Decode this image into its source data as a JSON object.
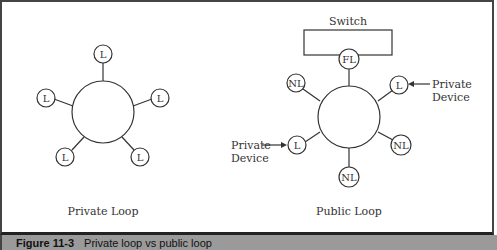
{
  "diagram": {
    "private_loop": {
      "label": "Private Loop",
      "nodes": [
        {
          "label": "L",
          "position": "top"
        },
        {
          "label": "L",
          "position": "upper-left"
        },
        {
          "label": "L",
          "position": "upper-right"
        },
        {
          "label": "L",
          "position": "lower-left"
        },
        {
          "label": "L",
          "position": "lower-right"
        }
      ]
    },
    "public_loop": {
      "label": "Public Loop",
      "switch_label": "Switch",
      "nodes": [
        {
          "label": "FL",
          "position": "top"
        },
        {
          "label": "NL",
          "position": "upper-left"
        },
        {
          "label": "L",
          "position": "upper-right"
        },
        {
          "label": "L",
          "position": "left"
        },
        {
          "label": "NL",
          "position": "lower-right"
        },
        {
          "label": "NL",
          "position": "bottom"
        }
      ],
      "annotations": [
        {
          "line1": "Private",
          "line2": "Device",
          "target": "upper-right L"
        },
        {
          "line1": "Private",
          "line2": "Device",
          "target": "left L"
        }
      ]
    }
  },
  "caption": {
    "figure_number": "Figure 11-3",
    "text": "Private loop vs public loop"
  },
  "colors": {
    "stroke": "#333333",
    "caption_bar": "#9a9a9a",
    "frame": "#444444"
  }
}
